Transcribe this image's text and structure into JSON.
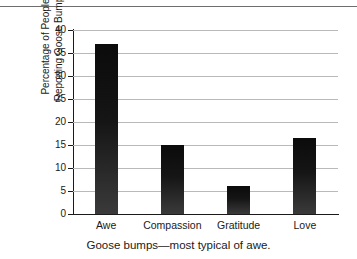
{
  "figure": {
    "caption": "Goose bumps—most typical of awe.",
    "top_rule_color": "#6e6e6e",
    "background_color": "#ffffff"
  },
  "chart_data": {
    "type": "bar",
    "title": "",
    "subtitle": "",
    "categories": [
      "Awe",
      "Compassion",
      "Gratitude",
      "Love"
    ],
    "values": [
      37,
      15,
      6,
      16.5
    ],
    "series": [
      {
        "name": "Percentage of People Reporting Goose Bumps",
        "values": [
          37,
          15,
          6,
          16.5
        ]
      }
    ],
    "xlabel": "",
    "ylabel": "Percentage of People Reporting Goose Bumps",
    "ylabel_lines": [
      "Percentage of People",
      "Reporting Goose Bumps"
    ],
    "ylim": [
      0,
      40
    ],
    "yticks": [
      0,
      5,
      10,
      15,
      20,
      25,
      30,
      35,
      40
    ],
    "ytick_labels": [
      "0",
      "5",
      "10",
      "15",
      "20",
      "25",
      "30",
      "35",
      "40"
    ],
    "grid": true,
    "grid_axis": "y",
    "grid_color": "#b9b9b9",
    "legend": false,
    "legend_position": "none",
    "bar_color": "#101010",
    "axis_color": "#1a1a1a"
  }
}
